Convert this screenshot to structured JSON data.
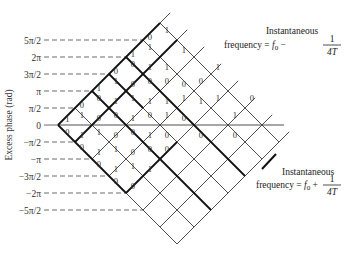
{
  "figure": {
    "y_axis_title": "Excess phase (rad)",
    "origin": {
      "x": 58,
      "y": 125
    },
    "step": 17,
    "y_ticks": [
      {
        "label": "5π/2",
        "level": 5
      },
      {
        "label": "2π",
        "level": 4
      },
      {
        "label": "3π/2",
        "level": 3
      },
      {
        "label": "π",
        "level": 2
      },
      {
        "label": "π/2",
        "level": 1
      },
      {
        "label": "0",
        "level": 0
      },
      {
        "label": "−π/2",
        "level": -1
      },
      {
        "label": "−π",
        "level": -2
      },
      {
        "label": "−3π/2",
        "level": -3
      },
      {
        "label": "−2π",
        "level": -4
      },
      {
        "label": "−5π/2",
        "level": -5
      }
    ],
    "annotations": {
      "upper": {
        "line1": "Instantaneous",
        "line2_prefix": "frequency = ",
        "f": "f",
        "sub": "0",
        "op": " − ",
        "num": "1",
        "den": "4T"
      },
      "lower": {
        "line1": "Instantaneous",
        "line2_prefix": "frequency = ",
        "f": "f",
        "sub": "0",
        "op": " + ",
        "num": "1",
        "den": "4T"
      }
    },
    "lattice": {
      "up_lines": {
        "count": 8,
        "length": 6.6
      },
      "down_lines": {
        "count": 7,
        "length": 7.0
      },
      "zero_line_end_k": 13.3
    },
    "bold_segments": [
      [
        [
          0,
          0
        ],
        [
          6,
          6
        ]
      ],
      [
        [
          0,
          0
        ],
        [
          4,
          -4
        ]
      ],
      [
        [
          4,
          -4
        ],
        [
          7,
          -1
        ]
      ],
      [
        [
          2,
          2
        ],
        [
          9,
          -5
        ]
      ],
      [
        [
          4,
          4
        ],
        [
          11,
          -3
        ]
      ],
      [
        [
          1,
          -1
        ],
        [
          7,
          5
        ]
      ],
      [
        [
          3,
          3
        ],
        [
          5,
          1
        ]
      ]
    ],
    "bits": [
      {
        "k": 0.55,
        "j": 0.35,
        "b": "1"
      },
      {
        "k": 0.55,
        "j": -0.4,
        "b": "0"
      },
      {
        "k": 1.4,
        "j": 1.2,
        "b": "0"
      },
      {
        "k": 1.4,
        "j": 0.6,
        "b": "1"
      },
      {
        "k": 1.4,
        "j": -0.6,
        "b": "1"
      },
      {
        "k": 1.4,
        "j": -1.3,
        "b": "0"
      },
      {
        "k": 2.4,
        "j": 2.2,
        "b": "1"
      },
      {
        "k": 2.4,
        "j": 1.6,
        "b": "0"
      },
      {
        "k": 2.4,
        "j": 0.4,
        "b": "0"
      },
      {
        "k": 2.4,
        "j": -0.4,
        "b": "1"
      },
      {
        "k": 2.4,
        "j": -1.6,
        "b": "1"
      },
      {
        "k": 2.4,
        "j": -2.3,
        "b": "0"
      },
      {
        "k": 3.4,
        "j": 3.2,
        "b": "0"
      },
      {
        "k": 3.4,
        "j": 2.6,
        "b": "1"
      },
      {
        "k": 3.4,
        "j": 1.4,
        "b": "1"
      },
      {
        "k": 3.4,
        "j": 0.6,
        "b": "0"
      },
      {
        "k": 3.4,
        "j": -0.6,
        "b": "0"
      },
      {
        "k": 3.4,
        "j": -1.4,
        "b": "1"
      },
      {
        "k": 3.4,
        "j": -2.6,
        "b": "1"
      },
      {
        "k": 3.4,
        "j": -3.3,
        "b": "0"
      },
      {
        "k": 4.4,
        "j": 4.2,
        "b": "1"
      },
      {
        "k": 4.4,
        "j": 3.6,
        "b": "0"
      },
      {
        "k": 4.4,
        "j": 2.4,
        "b": "0"
      },
      {
        "k": 4.4,
        "j": 1.6,
        "b": "1"
      },
      {
        "k": 4.4,
        "j": 0.4,
        "b": "1"
      },
      {
        "k": 4.4,
        "j": -0.4,
        "b": "0"
      },
      {
        "k": 4.4,
        "j": -1.6,
        "b": "0"
      },
      {
        "k": 4.4,
        "j": -2.4,
        "b": "1"
      },
      {
        "k": 4.4,
        "j": -3.6,
        "b": "0"
      },
      {
        "k": 5.4,
        "j": 5.2,
        "b": "0"
      },
      {
        "k": 5.4,
        "j": 4.6,
        "b": "1"
      },
      {
        "k": 5.4,
        "j": 3.4,
        "b": "1"
      },
      {
        "k": 5.4,
        "j": 2.6,
        "b": "0"
      },
      {
        "k": 5.4,
        "j": 1.4,
        "b": "1"
      },
      {
        "k": 5.4,
        "j": 0.6,
        "b": "0"
      },
      {
        "k": 5.4,
        "j": -0.6,
        "b": "1"
      },
      {
        "k": 5.4,
        "j": -1.4,
        "b": "0"
      },
      {
        "k": 5.4,
        "j": -2.6,
        "b": "1"
      },
      {
        "k": 6.4,
        "j": 5.6,
        "b": "1"
      },
      {
        "k": 6.4,
        "j": 3.4,
        "b": "1"
      },
      {
        "k": 6.4,
        "j": 2.6,
        "b": "0"
      },
      {
        "k": 6.4,
        "j": 1.4,
        "b": "1"
      },
      {
        "k": 6.4,
        "j": 0.6,
        "b": "1"
      },
      {
        "k": 6.4,
        "j": -0.6,
        "b": "0"
      },
      {
        "k": 6.4,
        "j": -1.4,
        "b": "0"
      },
      {
        "k": 7.4,
        "j": 4.4,
        "b": "1"
      },
      {
        "k": 7.4,
        "j": 2.4,
        "b": "0"
      },
      {
        "k": 7.4,
        "j": 1.6,
        "b": "1"
      },
      {
        "k": 7.4,
        "j": 0.4,
        "b": "0"
      },
      {
        "k": 8.4,
        "j": 2.6,
        "b": "0"
      },
      {
        "k": 8.4,
        "j": 1.4,
        "b": "1"
      },
      {
        "k": 8.4,
        "j": -0.6,
        "b": "0"
      },
      {
        "k": 9.4,
        "j": 3.4,
        "b": "1"
      },
      {
        "k": 9.4,
        "j": 1.6,
        "b": "1"
      },
      {
        "k": 10.4,
        "j": 0.6,
        "b": "1"
      },
      {
        "k": 10.4,
        "j": -0.6,
        "b": "0"
      },
      {
        "k": 11.4,
        "j": 1.6,
        "b": "0"
      }
    ],
    "colors": {
      "line": "#3a3a3a",
      "bold": "#111111",
      "dash": "#444444",
      "text": "#333333"
    }
  }
}
